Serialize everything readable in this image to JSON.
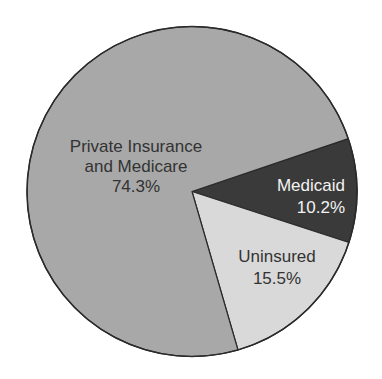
{
  "chart_data": {
    "type": "pie",
    "title": "",
    "slices": [
      {
        "label": "Medicaid",
        "value": 10.2,
        "value_label": "10.2%",
        "color": "#3a3a3a",
        "text_color": "#f2f2f2"
      },
      {
        "label": "Uninsured",
        "value": 15.5,
        "value_label": "15.5%",
        "color": "#d9d9d9",
        "text_color": "#333333"
      },
      {
        "label": "Private Insurance and Medicare",
        "value": 74.3,
        "value_label": "74.3%",
        "color": "#a8a8a8",
        "text_color": "#333333"
      }
    ],
    "legend": "none (labels drawn inside slices)"
  },
  "labels": {
    "private_line1": "Private Insurance",
    "private_line2": "and Medicare",
    "private_value": "74.3%",
    "medicaid_name": "Medicaid",
    "medicaid_value": "10.2%",
    "uninsured_name": "Uninsured",
    "uninsured_value": "15.5%"
  }
}
